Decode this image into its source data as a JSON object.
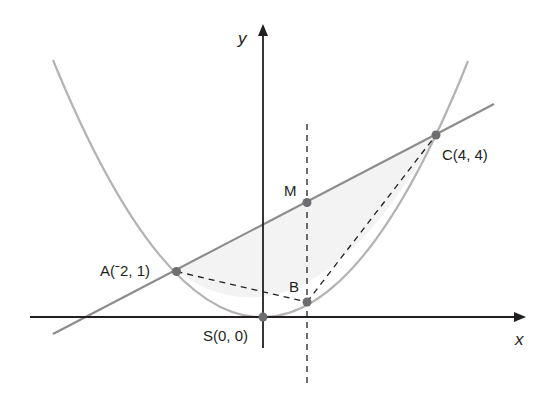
{
  "figure": {
    "type": "coordinate-diagram",
    "axes": {
      "x_label": "x",
      "y_label": "y"
    },
    "curve": {
      "name": "parabola",
      "equation_implied": "y = x^2/4",
      "color": "#b3b3b3"
    },
    "line": {
      "name": "line AC",
      "through": [
        "A",
        "C"
      ],
      "color": "#8c8c8c"
    },
    "vertical_dashed_line": {
      "x": 1
    },
    "points": [
      {
        "id": "A",
        "label": "A(‐2, 1)",
        "x": -2,
        "y": 1
      },
      {
        "id": "C",
        "label": "C(4, 4)",
        "x": 4,
        "y": 4
      },
      {
        "id": "S",
        "label": "S(0, 0)",
        "x": 0,
        "y": 0
      },
      {
        "id": "M",
        "label": "M",
        "x": 1,
        "y": 2.5
      },
      {
        "id": "B",
        "label": "B",
        "x": 1,
        "y": 0.25
      }
    ],
    "shaded_region": "between line AC and parabola from A to C",
    "dashed_segments": [
      "AB",
      "BC"
    ],
    "colors": {
      "axis": "#231f20",
      "point": "#6d6e71",
      "shade": "#f2f2f2",
      "dash": "#231f20"
    }
  },
  "labels": {
    "x_axis": "x",
    "y_axis": "y",
    "A": "A(ˉ2, 1)",
    "C": "C(4, 4)",
    "S": "S(0, 0)",
    "M": "M",
    "B": "B"
  }
}
